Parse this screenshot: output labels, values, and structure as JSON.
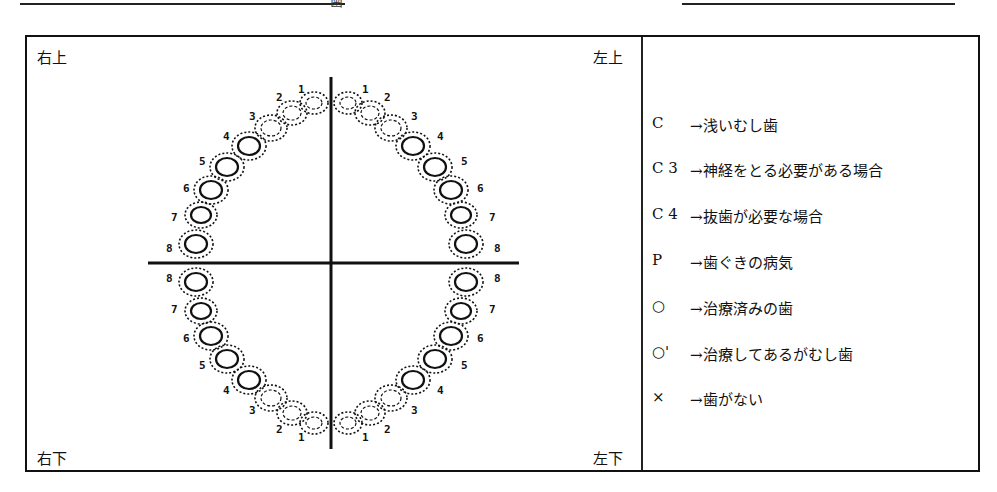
{
  "header": {
    "left_underline_mark": "歯"
  },
  "chart": {
    "corners": {
      "top_left": "右上",
      "top_right": "左上",
      "bottom_left": "右下",
      "bottom_right": "左下"
    },
    "tooth_numbers": [
      "1",
      "2",
      "3",
      "4",
      "5",
      "6",
      "7",
      "8"
    ]
  },
  "legend": {
    "items": [
      {
        "code": "C",
        "desc": "→浅いむし歯"
      },
      {
        "code": "C 3",
        "desc": "→神経をとる必要がある場合"
      },
      {
        "code": "C 4",
        "desc": "→抜歯が必要な場合"
      },
      {
        "code": "P",
        "desc": "→歯ぐきの病気"
      },
      {
        "code": "○",
        "desc": "→治療済みの歯"
      },
      {
        "code": "○'",
        "desc": "→治療してあるがむし歯"
      },
      {
        "code": "×",
        "desc": "→歯がない"
      }
    ]
  }
}
